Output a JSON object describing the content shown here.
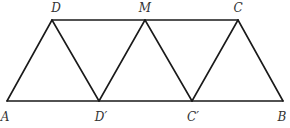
{
  "diagram": {
    "type": "geometry",
    "stroke_color": "#1a1a1a",
    "label_color": "#333333",
    "points": [
      {
        "id": "A",
        "label": "A",
        "x": 7,
        "y": 101,
        "lx": 5,
        "ly": 121,
        "anchor": "middle"
      },
      {
        "id": "D",
        "label": "D",
        "x": 52,
        "y": 20,
        "lx": 56,
        "ly": 12,
        "anchor": "middle"
      },
      {
        "id": "M",
        "label": "M",
        "x": 145,
        "y": 20,
        "lx": 145,
        "ly": 12,
        "anchor": "middle"
      },
      {
        "id": "C",
        "label": "C",
        "x": 238,
        "y": 20,
        "lx": 238,
        "ly": 12,
        "anchor": "middle"
      },
      {
        "id": "Dp",
        "label": "D′",
        "x": 99,
        "y": 101,
        "lx": 101,
        "ly": 121,
        "anchor": "middle"
      },
      {
        "id": "Cp",
        "label": "C′",
        "x": 192,
        "y": 101,
        "lx": 193,
        "ly": 121,
        "anchor": "middle"
      },
      {
        "id": "B",
        "label": "B",
        "x": 283,
        "y": 101,
        "lx": 282,
        "ly": 121,
        "anchor": "middle"
      }
    ],
    "segments": [
      {
        "name": "segment-dc",
        "from": "D",
        "to": "C"
      },
      {
        "name": "segment-ab",
        "from": "A",
        "to": "B"
      },
      {
        "name": "segment-ad",
        "from": "A",
        "to": "D"
      },
      {
        "name": "segment-dd-prime",
        "from": "D",
        "to": "Dp"
      },
      {
        "name": "segment-d-prime-m",
        "from": "Dp",
        "to": "M"
      },
      {
        "name": "segment-m-c-prime",
        "from": "M",
        "to": "Cp"
      },
      {
        "name": "segment-c-prime-c",
        "from": "Cp",
        "to": "C"
      },
      {
        "name": "segment-cb",
        "from": "C",
        "to": "B"
      }
    ]
  }
}
